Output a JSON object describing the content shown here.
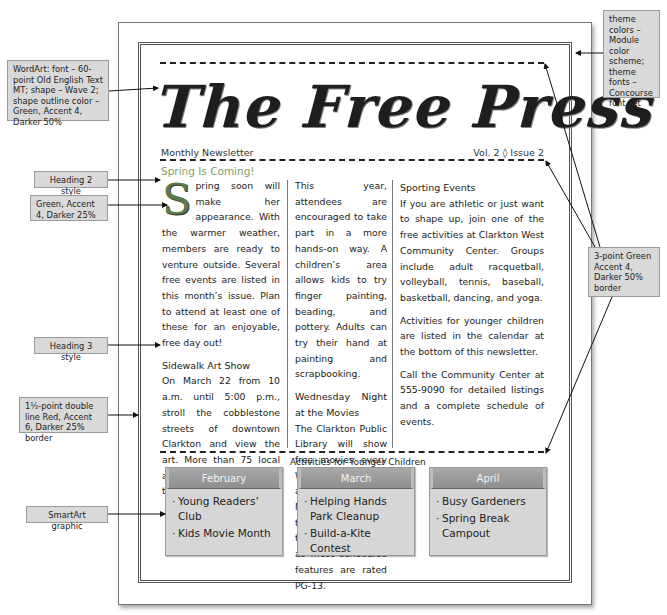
{
  "newsletter": {
    "title": "The Free Press",
    "subtitle_left": "Monthly Newsletter",
    "subtitle_right": "Vol. 2 ◊ Issue 2"
  },
  "article": {
    "heading": "Spring Is Coming!",
    "col1": {
      "dropcap": "S",
      "intro": "pring soon will make her appearance. With the warmer weather, members are ready to venture outside. Several free events are listed in this month’s issue. Plan to attend at least one of these for an enjoyable, free day out!",
      "section_heading": "Sidewalk Art Show",
      "section_body": "On March 22 from 10 a.m. until 5:00 p.m., stroll the cobblestone streets of downtown Clarkton and view the art. More than 75 local artists will showcase their wares."
    },
    "col2": {
      "intro": "This year, attendees are encouraged to take part in a more hands-on way. A children’s area allows kids to try finger painting, beading, and pottery. Adults can try their hand at painting and scrapbooking.",
      "section_heading": "Wednesday Night at the Movies",
      "section_body": "The Clarkton Public Library will show free movies every Wednesday night at 7:00 p.m. during March. Note that this event is for teens and adults, as most scheduled features are rated PG-13."
    },
    "col3": {
      "section_heading": "Sporting Events",
      "section_body": "If you are athletic or just want to shape up, join one of the free activities at Clarkton West Community Center. Groups include adult racquetball, volleyball, tennis, baseball, basketball, dancing, and yoga.",
      "para2": "Activities for younger children are listed in the calendar at the bottom of this newsletter.",
      "para3": "Call the Community Center at 555-9090 for detailed listings and a complete schedule of events."
    }
  },
  "smartart": {
    "caption": "Activities for Younger Children",
    "boxes": [
      {
        "month": "February",
        "items": [
          "Young Readers’ Club",
          "Kids Movie Month"
        ]
      },
      {
        "month": "March",
        "items": [
          "Helping Hands Park Cleanup",
          "Build-a-Kite Contest"
        ]
      },
      {
        "month": "April",
        "items": [
          "Busy Gardeners",
          "Spring Break Campout"
        ]
      }
    ]
  },
  "callouts": {
    "wordart": "WordArt: font – 60-point Old English Text MT; shape – Wave 2; shape outline color – Green, Accent 4, Darker 50%",
    "theme": "theme colors – Module color scheme; theme fonts – Concourse font set",
    "heading2": "Heading 2 style",
    "dropcap_color": "Green, Accent 4, Darker 25%",
    "heading3": "Heading 3 style",
    "page_border": "1½-point double line Red, Accent 6, Darker 25% border",
    "smartart": "SmartArt graphic",
    "dashed_border": "3-point Green Accent 4, Darker 50% border"
  },
  "colors": {
    "heading2": "#7f9f6a",
    "dropcap": "#5b7a4a",
    "callout_bg": "#d9d9d9",
    "smartart_header": "#9a9a9a",
    "smartart_body": "#d6d6d6"
  }
}
